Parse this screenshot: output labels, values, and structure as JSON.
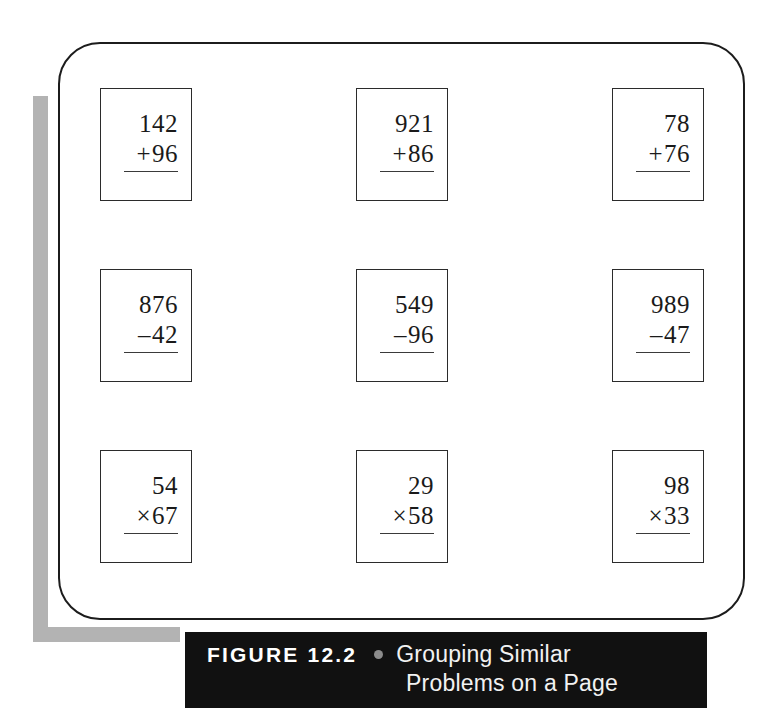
{
  "figure": {
    "label": "FIGURE 12.2",
    "bullet_icon": "bullet-separator-icon",
    "caption_line_1": "Grouping Similar",
    "caption_line_2": "Problems on a Page",
    "bar_color": "#111111",
    "bullet_color": "#8c8c8c",
    "shadow_color": "#b3b3b3",
    "border_color": "#1c1c1c"
  },
  "problems": [
    {
      "top": "142",
      "sign": "+",
      "bottom": "96"
    },
    {
      "top": "921",
      "sign": "+",
      "bottom": "86"
    },
    {
      "top": "78",
      "sign": "+",
      "bottom": "76"
    },
    {
      "top": "876",
      "sign": "–",
      "bottom": "42"
    },
    {
      "top": "549",
      "sign": "–",
      "bottom": "96"
    },
    {
      "top": "989",
      "sign": "–",
      "bottom": "47"
    },
    {
      "top": "54",
      "sign": "×",
      "bottom": "67"
    },
    {
      "top": "29",
      "sign": "×",
      "bottom": "58"
    },
    {
      "top": "98",
      "sign": "×",
      "bottom": "33"
    }
  ]
}
